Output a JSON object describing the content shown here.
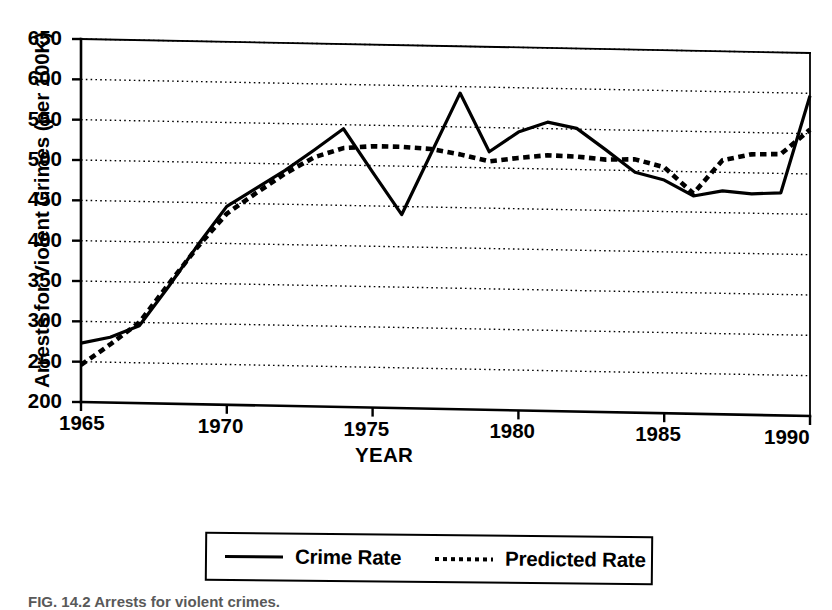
{
  "figure": {
    "caption": "FIG. 14.2  Arrests for violent crimes."
  },
  "chart_data": {
    "type": "line",
    "title": "",
    "xlabel": "YEAR",
    "ylabel": "Arrests for Violent Crimes (per 100K)",
    "xlim": [
      1965,
      1990
    ],
    "ylim": [
      200,
      650
    ],
    "xticks": [
      1965,
      1970,
      1975,
      1980,
      1985,
      1990
    ],
    "xtick_labels": [
      "1965",
      "1970",
      "1975",
      "1980",
      "1985",
      "1990"
    ],
    "yticks": [
      200,
      250,
      300,
      350,
      400,
      450,
      500,
      550,
      600,
      650
    ],
    "ytick_labels": [
      "200",
      "250",
      "300",
      "350",
      "400",
      "450",
      "500",
      "550",
      "600",
      "650"
    ],
    "grid": "horizontal-dotted",
    "legend_position": "below-plot",
    "x": [
      1965,
      1966,
      1967,
      1968,
      1969,
      1970,
      1971,
      1972,
      1973,
      1974,
      1975,
      1976,
      1977,
      1978,
      1979,
      1980,
      1981,
      1982,
      1983,
      1984,
      1985,
      1986,
      1987,
      1988,
      1989,
      1990
    ],
    "series": [
      {
        "name": "Crime Rate",
        "style": "solid",
        "color": "#000000",
        "values": [
          273,
          281,
          296,
          345,
          397,
          446,
          469,
          492,
          518,
          545,
          492,
          440,
          516,
          592,
          520,
          545,
          558,
          551,
          525,
          498,
          489,
          470,
          477,
          474,
          476,
          597
        ]
      },
      {
        "name": "Predicted Rate",
        "style": "dotted",
        "color": "#000000",
        "values": [
          246,
          272,
          300,
          348,
          395,
          437,
          463,
          488,
          509,
          521,
          524,
          524,
          522,
          516,
          508,
          513,
          517,
          516,
          513,
          514,
          505,
          473,
          515,
          523,
          524,
          555
        ]
      }
    ]
  },
  "legend": {
    "entries": [
      {
        "label": "Crime Rate",
        "style": "solid"
      },
      {
        "label": "Predicted Rate",
        "style": "dotted"
      }
    ]
  }
}
